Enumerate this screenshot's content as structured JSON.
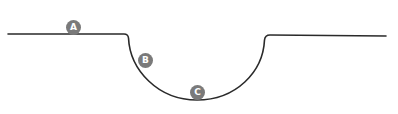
{
  "diagram": {
    "colors": {
      "line": "#2a2a2a",
      "marker_fill": "#7a7a7a",
      "marker_text": "#ffffff",
      "background": "#ffffff"
    },
    "path": {
      "left_flat": {
        "x1": 8,
        "y1": 34,
        "x2": 126,
        "y2": 34
      },
      "trough_bottom": {
        "x": 197,
        "y": 100
      },
      "right_flat": {
        "x1": 266,
        "y1": 35,
        "x2": 386,
        "y2": 36
      }
    },
    "markers": [
      {
        "id": "A",
        "label": "A",
        "x": 73,
        "y": 27
      },
      {
        "id": "B",
        "label": "B",
        "x": 145,
        "y": 60
      },
      {
        "id": "C",
        "label": "C",
        "x": 197,
        "y": 92
      }
    ]
  }
}
